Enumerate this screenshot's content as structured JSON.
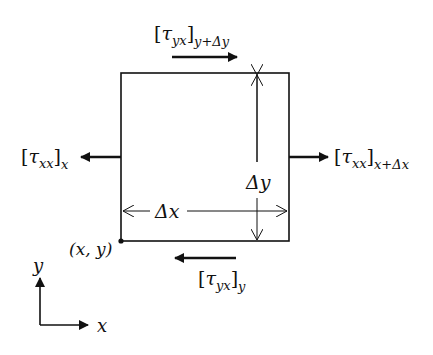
{
  "diagram": {
    "element": {
      "corner_label": "(x, y)",
      "width_label": "Δx",
      "height_label": "Δy"
    },
    "stresses": {
      "top": {
        "symbol": "τ",
        "sub": "yx",
        "at": "y+Δy",
        "direction": "right"
      },
      "bottom": {
        "symbol": "τ",
        "sub": "yx",
        "at": "y",
        "direction": "left"
      },
      "left": {
        "symbol": "τ",
        "sub": "xx",
        "at": "x",
        "direction": "left"
      },
      "right": {
        "symbol": "τ",
        "sub": "xx",
        "at": "x+Δx",
        "direction": "right"
      }
    },
    "axes": {
      "x_label": "x",
      "y_label": "y"
    },
    "colors": {
      "ink": "#111111",
      "background": "#ffffff"
    }
  }
}
